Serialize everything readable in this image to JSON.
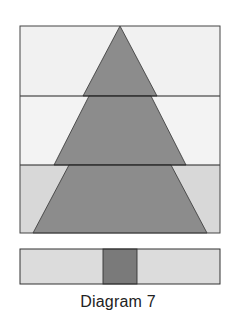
{
  "caption": "Diagram 7",
  "colors": {
    "outline": "#333333",
    "tree": "#8c8c8c",
    "trunk": "#7a7a7a",
    "tier_top_bg": "#f1f1f1",
    "tier_middle_bg": "#f3f3f3",
    "tier_bottom_bg": "#d8d8d8",
    "trunk_strip_bg": "#dcdcdc"
  },
  "tree_block": {
    "description": "Pieced quilt block showing a tree made of three stacked rows",
    "rows": [
      {
        "name": "top",
        "shape": "triangle",
        "background": "light"
      },
      {
        "name": "middle",
        "shape": "trapezoid",
        "background": "light"
      },
      {
        "name": "bottom",
        "shape": "trapezoid",
        "background": "medium-light"
      }
    ]
  },
  "trunk_strip": {
    "description": "Horizontal strip with center trunk square",
    "segments": [
      "background",
      "trunk",
      "background"
    ]
  }
}
